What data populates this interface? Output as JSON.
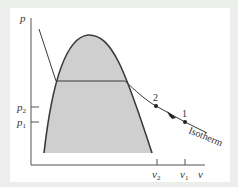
{
  "diagram": {
    "type": "p-v diagram with saturation dome and isotherm",
    "axes": {
      "y_label": "p",
      "x_label": "v",
      "y_ticks": [
        {
          "label_base": "p",
          "label_sub": "2",
          "y": 107
        },
        {
          "label_base": "p",
          "label_sub": "1",
          "y": 122
        }
      ],
      "x_ticks": [
        {
          "label_base": "v",
          "label_sub": "2",
          "x": 157
        },
        {
          "label_base": "v",
          "label_sub": "1",
          "x": 185
        }
      ]
    },
    "points": [
      {
        "label": "2",
        "x": 156,
        "y": 106
      },
      {
        "label": "1",
        "x": 185,
        "y": 122
      }
    ],
    "curve_label": "Isotherm",
    "colors": {
      "background": "#eceeec",
      "panel": "#ffffff",
      "dome_fill": "#cfcfcf",
      "line": "#3a3a3a"
    }
  }
}
